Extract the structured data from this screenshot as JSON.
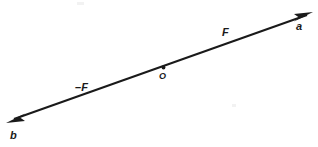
{
  "figure": {
    "background_color": "#ffffff",
    "stroke_color": "#1a1a1a",
    "labels": {
      "endpoint_right": "a",
      "endpoint_left": "b",
      "vector_positive": "F",
      "vector_negative": "–F",
      "origin_point": "O"
    },
    "geometry": {
      "line_start": [
        8,
        122
      ],
      "line_end": [
        312,
        13
      ],
      "origin_dot": [
        163,
        68
      ],
      "arrowhead_right": "arrow-right",
      "arrowhead_left": "arrow-left",
      "line_width_px": 2
    }
  }
}
